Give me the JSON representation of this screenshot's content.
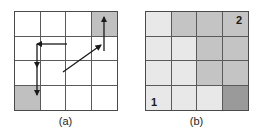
{
  "figure": {
    "background": "#ffffff",
    "grid_line_color": "#5a5a5a"
  },
  "palette": {
    "white": "#ffffff",
    "light_gray": "#e6e6e6",
    "medium_gray": "#c8c8c8",
    "dark_gray": "#9e9e9e",
    "stroke": "#1a1a1a"
  },
  "panels": [
    {
      "id": "a",
      "caption": "(a)",
      "grid": {
        "rows": 4,
        "cols": 4,
        "cells": [
          {
            "row": 1,
            "col": 1,
            "fill": "#ffffff",
            "label": ""
          },
          {
            "row": 1,
            "col": 2,
            "fill": "#ffffff",
            "label": ""
          },
          {
            "row": 1,
            "col": 3,
            "fill": "#ffffff",
            "label": ""
          },
          {
            "row": 1,
            "col": 4,
            "fill": "#c0c0c0",
            "label": ""
          },
          {
            "row": 2,
            "col": 1,
            "fill": "#ffffff",
            "label": ""
          },
          {
            "row": 2,
            "col": 2,
            "fill": "#ffffff",
            "label": ""
          },
          {
            "row": 2,
            "col": 3,
            "fill": "#ffffff",
            "label": ""
          },
          {
            "row": 2,
            "col": 4,
            "fill": "#ffffff",
            "label": ""
          },
          {
            "row": 3,
            "col": 1,
            "fill": "#ffffff",
            "label": ""
          },
          {
            "row": 3,
            "col": 2,
            "fill": "#ffffff",
            "label": ""
          },
          {
            "row": 3,
            "col": 3,
            "fill": "#ffffff",
            "label": ""
          },
          {
            "row": 3,
            "col": 4,
            "fill": "#ffffff",
            "label": ""
          },
          {
            "row": 4,
            "col": 1,
            "fill": "#c0c0c0",
            "label": ""
          },
          {
            "row": 4,
            "col": 2,
            "fill": "#ffffff",
            "label": ""
          },
          {
            "row": 4,
            "col": 3,
            "fill": "#ffffff",
            "label": ""
          },
          {
            "row": 4,
            "col": 4,
            "fill": "#ffffff",
            "label": ""
          }
        ]
      },
      "arrows": [
        {
          "name": "arrow-up-right-cell",
          "kind": "straight",
          "x1": 90,
          "y1": 40,
          "x2": 90,
          "y2": 6,
          "head": "end"
        },
        {
          "name": "arrow-diagonal-up-right",
          "kind": "straight",
          "x1": 49,
          "y1": 61,
          "x2": 87,
          "y2": 34,
          "head": "end"
        },
        {
          "name": "arrow-left-horizontal",
          "kind": "straight",
          "x1": 53,
          "y1": 33,
          "x2": 23,
          "y2": 33,
          "head": "end"
        },
        {
          "name": "arrow-down-first",
          "kind": "straight",
          "x1": 23,
          "y1": 33,
          "x2": 23,
          "y2": 56,
          "head": "end"
        },
        {
          "name": "arrow-down-second",
          "kind": "straight",
          "x1": 23,
          "y1": 56,
          "x2": 23,
          "y2": 84,
          "head": "end"
        }
      ]
    },
    {
      "id": "b",
      "caption": "(b)",
      "grid": {
        "rows": 4,
        "cols": 4,
        "cells": [
          {
            "row": 1,
            "col": 1,
            "fill": "#e8e8e8",
            "label": ""
          },
          {
            "row": 1,
            "col": 2,
            "fill": "#c4c4c4",
            "label": ""
          },
          {
            "row": 1,
            "col": 3,
            "fill": "#c4c4c4",
            "label": ""
          },
          {
            "row": 1,
            "col": 4,
            "fill": "#c4c4c4",
            "label": "2"
          },
          {
            "row": 2,
            "col": 1,
            "fill": "#e8e8e8",
            "label": ""
          },
          {
            "row": 2,
            "col": 2,
            "fill": "#e8e8e8",
            "label": ""
          },
          {
            "row": 2,
            "col": 3,
            "fill": "#c4c4c4",
            "label": ""
          },
          {
            "row": 2,
            "col": 4,
            "fill": "#c4c4c4",
            "label": ""
          },
          {
            "row": 3,
            "col": 1,
            "fill": "#e8e8e8",
            "label": ""
          },
          {
            "row": 3,
            "col": 2,
            "fill": "#e8e8e8",
            "label": ""
          },
          {
            "row": 3,
            "col": 3,
            "fill": "#c4c4c4",
            "label": ""
          },
          {
            "row": 3,
            "col": 4,
            "fill": "#c4c4c4",
            "label": ""
          },
          {
            "row": 4,
            "col": 1,
            "fill": "#e8e8e8",
            "label": "1"
          },
          {
            "row": 4,
            "col": 2,
            "fill": "#e8e8e8",
            "label": ""
          },
          {
            "row": 4,
            "col": 3,
            "fill": "#e8e8e8",
            "label": ""
          },
          {
            "row": 4,
            "col": 4,
            "fill": "#9a9a9a",
            "label": ""
          }
        ]
      },
      "arrows": []
    }
  ]
}
